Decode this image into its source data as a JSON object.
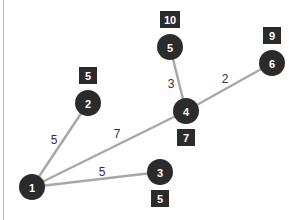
{
  "colors": {
    "node": "#2b2b2b",
    "edge": "#a8a8a8",
    "label": "#333333",
    "weight_box": "#2b2b2b"
  },
  "nodes": [
    {
      "id": "1",
      "label": "1",
      "weight": null
    },
    {
      "id": "2",
      "label": "2",
      "weight": "5"
    },
    {
      "id": "3",
      "label": "3",
      "weight": "5"
    },
    {
      "id": "4",
      "label": "4",
      "weight": "7"
    },
    {
      "id": "5",
      "label": "5",
      "weight": "10"
    },
    {
      "id": "6",
      "label": "6",
      "weight": "9"
    }
  ],
  "edges": [
    {
      "from": "1",
      "to": "2",
      "label": "5"
    },
    {
      "from": "1",
      "to": "4",
      "label": "7"
    },
    {
      "from": "1",
      "to": "3",
      "label": "5"
    },
    {
      "from": "4",
      "to": "5",
      "label": "3"
    },
    {
      "from": "4",
      "to": "6",
      "label": "2"
    }
  ]
}
